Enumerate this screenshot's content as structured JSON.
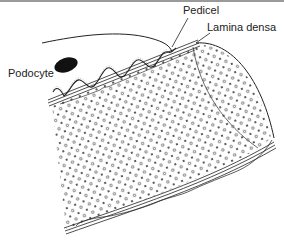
{
  "figure": {
    "labels": {
      "pedicel": "Pedicel",
      "lamina_densa": "Lamina densa",
      "podocyte": "Podocyte"
    },
    "colors": {
      "ink": "#222222",
      "top_border": "#9a9a9a",
      "background": "#ffffff"
    }
  }
}
